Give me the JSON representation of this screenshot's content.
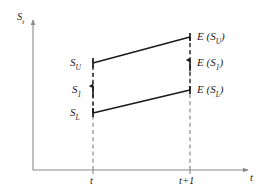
{
  "figure": {
    "type": "line-diagram",
    "background_color": "#ffffff",
    "line_color": "#1b1b1b",
    "axis_color": "#8a8a8a",
    "dash_color": "#8a8a8a"
  },
  "axes": {
    "y_label": "S",
    "y_label_sub": "t",
    "x_label": "t",
    "x_ticks": [
      {
        "label": "t",
        "x": 93
      },
      {
        "label": "t+1",
        "x": 190
      }
    ],
    "origin": {
      "x": 33,
      "y": 170
    },
    "y_top": 18,
    "x_right": 250
  },
  "points_t": [
    {
      "name": "S_U",
      "base": "S",
      "sub": "U",
      "x": 93,
      "y": 63
    },
    {
      "name": "S_1",
      "base": "S",
      "sub": "1",
      "x": 93,
      "y": 90
    },
    {
      "name": "S_L",
      "base": "S",
      "sub": "L",
      "x": 93,
      "y": 113
    }
  ],
  "points_t1": [
    {
      "name": "E(S_U)",
      "base": "E (S",
      "sub": "U",
      "tail": ")",
      "x": 190,
      "y": 37
    },
    {
      "name": "E(S_1)",
      "base": "E (S",
      "sub": "1",
      "tail": ")",
      "x": 190,
      "y": 63
    },
    {
      "name": "E(S_L)",
      "base": "E (S",
      "sub": "L",
      "tail": ")",
      "x": 190,
      "y": 90
    }
  ],
  "connectors": [
    {
      "name": "upper-trajectory",
      "from": "S_U",
      "to": "E(S_U)",
      "x1": 93,
      "y1": 63,
      "x2": 190,
      "y2": 37
    },
    {
      "name": "lower-trajectory",
      "from": "S_L",
      "to": "E(S_L)",
      "x1": 93,
      "y1": 113,
      "x2": 190,
      "y2": 90
    }
  ],
  "labels": {
    "y_axis": "S",
    "y_axis_sub": "t",
    "x_axis": "t",
    "tick_t": "t",
    "tick_t1": "t+1",
    "su": "S",
    "su_sub": "U",
    "s1": "S",
    "s1_sub": "1",
    "sl": "S",
    "sl_sub": "L",
    "esu_pre": "E (S",
    "esu_sub": "U",
    "esu_post": ")",
    "es1_pre": "E (S",
    "es1_sub": "1",
    "es1_post": ")",
    "esl_pre": "E (S",
    "esl_sub": "L",
    "esl_post": ")"
  }
}
